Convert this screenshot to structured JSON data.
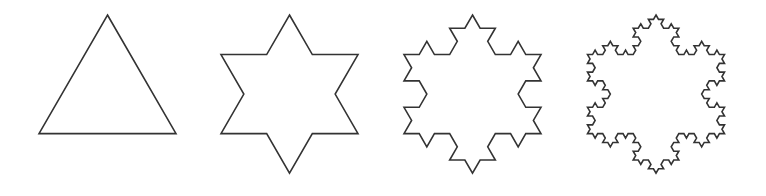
{
  "figure": {
    "stroke_color": "#333333",
    "background": "#ffffff",
    "stroke_width": 1.6,
    "side_length": 137,
    "apex_y": 15,
    "shapes": [
      {
        "name": "koch-iteration-0",
        "iteration": 0,
        "center_x": 107.5
      },
      {
        "name": "koch-iteration-1",
        "iteration": 1,
        "center_x": 289.5
      },
      {
        "name": "koch-iteration-2",
        "iteration": 2,
        "center_x": 472.5
      },
      {
        "name": "koch-iteration-3",
        "iteration": 3,
        "center_x": 656
      }
    ]
  }
}
